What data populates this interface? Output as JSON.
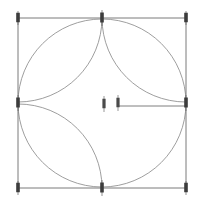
{
  "app": {
    "title": "Geometric Construction Sketch",
    "background_color": "#ffffff"
  },
  "colors": {
    "frame_stroke": "#7a7a7a",
    "arc_stroke": "#8d8d8d",
    "circle_stroke": "#8d8d8d",
    "radius_stroke": "#6f6f6f",
    "pin_fill": "#3c3c3c",
    "center_pin_fill": "#4a4a4a"
  },
  "canvas": {
    "width": 207,
    "height": 208
  },
  "sketch": {
    "type": "compass-and-straightedge-construction",
    "frame": {
      "label": "bounding-square",
      "left": 18,
      "top": 18,
      "right": 186,
      "bottom": 188,
      "width": 168,
      "height": 170
    },
    "main_circle": {
      "label": "inscribed-circle",
      "cx": 102,
      "cy": 103,
      "r": 84
    },
    "arcs": [
      {
        "label": "arc-from-top-left-corner",
        "cx": 18,
        "cy": 18,
        "r": 84
      },
      {
        "label": "arc-from-top-right-corner",
        "cx": 186,
        "cy": 18,
        "r": 84
      },
      {
        "label": "arc-from-bottom-left-corner",
        "cx": 18,
        "cy": 188,
        "r": 84
      },
      {
        "label": "arc-from-bottom-right-corner",
        "cx": 186,
        "cy": 188,
        "r": 84
      }
    ],
    "radius_line": {
      "label": "horizontal-radius",
      "x1": 118,
      "y1": 106,
      "x2": 186,
      "y2": 106
    }
  },
  "nodes": [
    {
      "name": "node-corner-top-left",
      "x": 18,
      "y": 18,
      "kind": "corner"
    },
    {
      "name": "node-corner-top-right",
      "x": 186,
      "y": 18,
      "kind": "corner"
    },
    {
      "name": "node-corner-bottom-left",
      "x": 18,
      "y": 188,
      "kind": "corner"
    },
    {
      "name": "node-corner-bottom-right",
      "x": 186,
      "y": 188,
      "kind": "corner"
    },
    {
      "name": "node-midpoint-top",
      "x": 102,
      "y": 18,
      "kind": "midpoint"
    },
    {
      "name": "node-midpoint-bottom",
      "x": 102,
      "y": 188,
      "kind": "midpoint"
    },
    {
      "name": "node-midpoint-left",
      "x": 18,
      "y": 103,
      "kind": "midpoint"
    },
    {
      "name": "node-midpoint-right",
      "x": 186,
      "y": 103,
      "kind": "midpoint"
    }
  ],
  "center_nodes": [
    {
      "name": "center-pin-left",
      "x": 104,
      "y": 104,
      "kind": "center"
    },
    {
      "name": "center-pin-right",
      "x": 118,
      "y": 103,
      "kind": "center"
    }
  ]
}
